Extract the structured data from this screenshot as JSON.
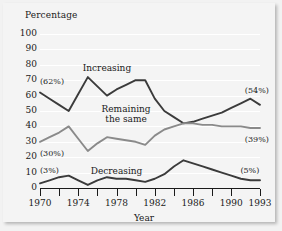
{
  "chart_data": {
    "type": "line",
    "title": "",
    "ylabel": "Percentage",
    "xlabel": "Year",
    "ylim": [
      0,
      100
    ],
    "yticks": [
      0,
      10,
      20,
      30,
      40,
      50,
      60,
      70,
      80,
      90,
      100
    ],
    "ytick_labels": [
      "0",
      "10",
      "20",
      "30",
      "40",
      "50",
      "60",
      "70",
      "80",
      "90",
      "100"
    ],
    "xlim": [
      1970,
      1993
    ],
    "xticks": [
      1970,
      1972,
      1974,
      1976,
      1978,
      1980,
      1982,
      1984,
      1986,
      1988,
      1990,
      1993
    ],
    "xtick_labels": [
      "1970",
      "",
      "1974",
      "",
      "1978",
      "",
      "1982",
      "",
      "1986",
      "",
      "1990",
      "1993"
    ],
    "grid": true,
    "grid_color": "#ffffff",
    "background": "#f4f4f4",
    "legend": "inline-annotations",
    "x": [
      1970,
      1971,
      1972,
      1973,
      1974,
      1975,
      1976,
      1977,
      1978,
      1979,
      1980,
      1981,
      1982,
      1983,
      1984,
      1985,
      1986,
      1987,
      1988,
      1989,
      1990,
      1991,
      1992,
      1993
    ],
    "series": [
      {
        "name": "Increasing",
        "color": "#3b3b3b",
        "values": [
          62,
          58,
          54,
          50,
          61,
          72,
          66,
          60,
          64,
          67,
          70,
          70,
          58,
          50,
          46,
          42,
          43,
          45,
          47,
          49,
          52,
          55,
          58,
          54
        ]
      },
      {
        "name": "Remaining the same",
        "color": "#8a8a8a",
        "values": [
          30,
          33,
          36,
          40,
          32,
          24,
          29,
          33,
          32,
          31,
          30,
          28,
          34,
          38,
          40,
          42,
          42,
          41,
          41,
          40,
          40,
          40,
          39,
          39
        ]
      },
      {
        "name": "Decreasing",
        "color": "#3b3b3b",
        "values": [
          3,
          5,
          7,
          8,
          5,
          2,
          5,
          7,
          6,
          6,
          5,
          4,
          6,
          9,
          14,
          18,
          16,
          14,
          12,
          10,
          8,
          6,
          5,
          5
        ]
      }
    ],
    "annotations": [
      {
        "text": "(62%)",
        "x": 1970,
        "y": 69,
        "series": "Increasing"
      },
      {
        "text": "(30%)",
        "x": 1970,
        "y": 22,
        "series": "Remaining the same"
      },
      {
        "text": "(3%)",
        "x": 1970,
        "y": 11,
        "series": "Decreasing"
      },
      {
        "text": "(54%)",
        "x": 1991,
        "y": 63,
        "series": "Increasing"
      },
      {
        "text": "(39%)",
        "x": 1991,
        "y": 31,
        "series": "Remaining the same"
      },
      {
        "text": "(5%)",
        "x": 1990,
        "y": 11,
        "series": "Decreasing"
      }
    ],
    "series_labels": [
      {
        "text": "Increasing",
        "x": 1977,
        "y": 78
      },
      {
        "text": "Remaining",
        "x": 1979,
        "y": 51
      },
      {
        "text": "the same",
        "x": 1979,
        "y": 45
      },
      {
        "text": "Decreasing",
        "x": 1978,
        "y": 11
      }
    ]
  },
  "axes": {
    "y_title": "Percentage",
    "x_title": "Year"
  }
}
